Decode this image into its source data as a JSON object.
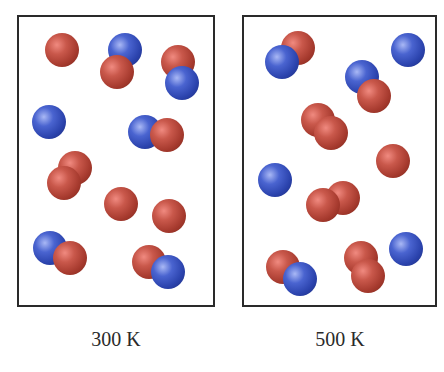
{
  "colors": {
    "atom_a": "#b5473a",
    "atom_b": "#3550c0",
    "border": "#2a2a2a",
    "background": "#ffffff"
  },
  "panels": [
    {
      "id": "left",
      "label": "300 K",
      "atoms": [
        {
          "type": "red",
          "x": 62,
          "y": 50,
          "r": 17
        },
        {
          "type": "blue",
          "x": 125,
          "y": 50,
          "r": 17
        },
        {
          "type": "red",
          "x": 117,
          "y": 72,
          "r": 17
        },
        {
          "type": "red",
          "x": 178,
          "y": 62,
          "r": 17
        },
        {
          "type": "blue",
          "x": 182,
          "y": 83,
          "r": 17
        },
        {
          "type": "blue",
          "x": 49,
          "y": 122,
          "r": 17
        },
        {
          "type": "blue",
          "x": 145,
          "y": 132,
          "r": 17
        },
        {
          "type": "red",
          "x": 167,
          "y": 135,
          "r": 17
        },
        {
          "type": "red",
          "x": 75,
          "y": 168,
          "r": 17
        },
        {
          "type": "red",
          "x": 64,
          "y": 183,
          "r": 17
        },
        {
          "type": "red",
          "x": 121,
          "y": 204,
          "r": 17
        },
        {
          "type": "red",
          "x": 169,
          "y": 216,
          "r": 17
        },
        {
          "type": "blue",
          "x": 50,
          "y": 248,
          "r": 17
        },
        {
          "type": "red",
          "x": 70,
          "y": 258,
          "r": 17
        },
        {
          "type": "red",
          "x": 149,
          "y": 262,
          "r": 17
        },
        {
          "type": "blue",
          "x": 168,
          "y": 272,
          "r": 17
        }
      ]
    },
    {
      "id": "right",
      "label": "500 K",
      "atoms": [
        {
          "type": "red",
          "x": 298,
          "y": 48,
          "r": 17
        },
        {
          "type": "blue",
          "x": 282,
          "y": 62,
          "r": 17
        },
        {
          "type": "blue",
          "x": 408,
          "y": 50,
          "r": 17
        },
        {
          "type": "blue",
          "x": 362,
          "y": 77,
          "r": 17
        },
        {
          "type": "red",
          "x": 374,
          "y": 96,
          "r": 17
        },
        {
          "type": "red",
          "x": 318,
          "y": 120,
          "r": 17
        },
        {
          "type": "red",
          "x": 331,
          "y": 133,
          "r": 17
        },
        {
          "type": "red",
          "x": 393,
          "y": 161,
          "r": 17
        },
        {
          "type": "blue",
          "x": 275,
          "y": 180,
          "r": 17
        },
        {
          "type": "red",
          "x": 343,
          "y": 198,
          "r": 17
        },
        {
          "type": "red",
          "x": 323,
          "y": 205,
          "r": 17
        },
        {
          "type": "blue",
          "x": 406,
          "y": 249,
          "r": 17
        },
        {
          "type": "red",
          "x": 283,
          "y": 267,
          "r": 17
        },
        {
          "type": "blue",
          "x": 300,
          "y": 279,
          "r": 17
        },
        {
          "type": "red",
          "x": 361,
          "y": 258,
          "r": 17
        },
        {
          "type": "red",
          "x": 368,
          "y": 276,
          "r": 17
        }
      ]
    }
  ]
}
